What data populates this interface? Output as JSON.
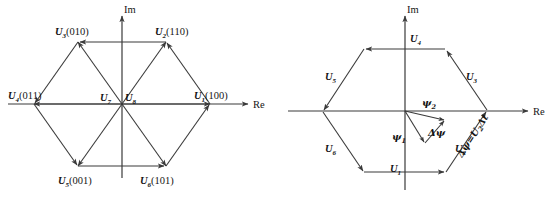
{
  "figure": {
    "background_color": "#ffffff",
    "stroke_color": "#3a3a3a",
    "text_color": "#151515",
    "panels": [
      {
        "id": "left",
        "name": "basic-voltage-space-vectors",
        "axes": {
          "real_label": "Re",
          "imag_label": "Im"
        },
        "center_vectors": [
          {
            "symbol": "U",
            "subscript": "1",
            "bits": "(100)",
            "label": "U1(100)",
            "angle_deg": 0
          },
          {
            "symbol": "U",
            "subscript": "2",
            "bits": "(110)",
            "label": "U2(110)",
            "angle_deg": 60
          },
          {
            "symbol": "U",
            "subscript": "3",
            "bits": "(010)",
            "label": "U3(010)",
            "angle_deg": 120
          },
          {
            "symbol": "U",
            "subscript": "4",
            "bits": "(011)",
            "label": "U4(011)",
            "angle_deg": 180
          },
          {
            "symbol": "U",
            "subscript": "5",
            "bits": "(001)",
            "label": "U5(001)",
            "angle_deg": 240
          },
          {
            "symbol": "U",
            "subscript": "6",
            "bits": "(101)",
            "label": "U6(101)",
            "angle_deg": 300
          }
        ],
        "zero_vectors": [
          {
            "symbol": "U",
            "subscript": "7",
            "label": "U7"
          },
          {
            "symbol": "U",
            "subscript": "8",
            "label": "U8"
          }
        ]
      },
      {
        "id": "right",
        "name": "hexagonal-flux-trajectory",
        "axes": {
          "real_label": "Re",
          "imag_label": "Im"
        },
        "edge_vectors": [
          {
            "symbol": "U",
            "subscript": "1",
            "label": "U1",
            "position": "bottom"
          },
          {
            "symbol": "U",
            "subscript": "2",
            "label": "U2",
            "position": "lower-right"
          },
          {
            "symbol": "U",
            "subscript": "3",
            "label": "U3",
            "position": "upper-right"
          },
          {
            "symbol": "U",
            "subscript": "4",
            "label": "U4",
            "position": "top"
          },
          {
            "symbol": "U",
            "subscript": "5",
            "label": "U5",
            "position": "upper-left"
          },
          {
            "symbol": "U",
            "subscript": "6",
            "label": "U6",
            "position": "lower-left"
          }
        ],
        "flux_vectors": [
          {
            "symbol": "ψ",
            "subscript": "1",
            "label": "ψ1"
          },
          {
            "symbol": "ψ",
            "subscript": "2",
            "label": "ψ2"
          },
          {
            "symbol": "Δψ",
            "subscript": "",
            "label": "Δψ"
          }
        ],
        "equation": {
          "text": "Δψ=U₂Δt",
          "lhs": "Δψ",
          "equals": "=",
          "rhs_symbol": "U",
          "rhs_subscript": "2",
          "rhs_delta": "Δt",
          "rotation_deg": -57
        }
      }
    ]
  }
}
